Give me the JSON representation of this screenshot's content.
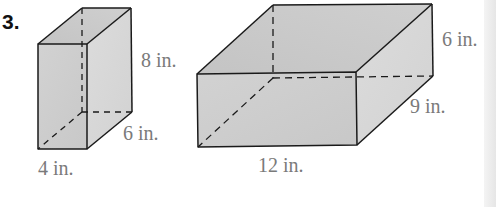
{
  "problem": {
    "number": "3."
  },
  "figures": [
    {
      "id": "prism-a",
      "shape": "rectangular prism",
      "labels": {
        "height": "8 in.",
        "depth": "6 in.",
        "width": "4 in."
      }
    },
    {
      "id": "prism-b",
      "shape": "rectangular prism",
      "labels": {
        "height": "6 in.",
        "depth": "9 in.",
        "width": "12 in."
      }
    }
  ],
  "colors": {
    "face_front": "#cfcfcf",
    "face_side": "#d9d9d9",
    "face_top": "#c6c6c6",
    "edge": "#1a1a1a",
    "label": "#7a7a7a"
  }
}
